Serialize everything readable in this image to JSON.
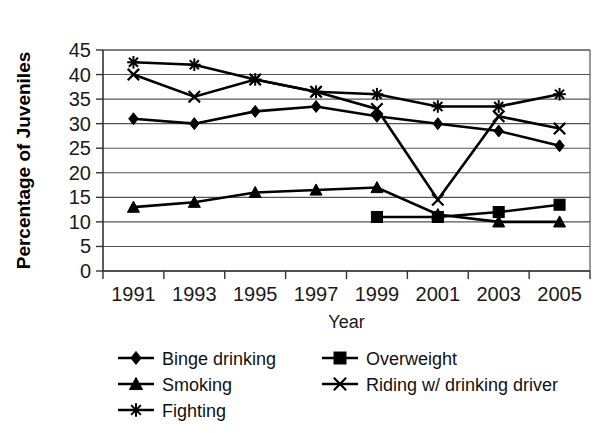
{
  "chart_data": {
    "type": "line",
    "title": "",
    "xlabel": "Year",
    "ylabel": "Percentage of Juveniles",
    "categories": [
      "1991",
      "1993",
      "1995",
      "1997",
      "1999",
      "2001",
      "2003",
      "2005"
    ],
    "x": [
      1991,
      1993,
      1995,
      1997,
      1999,
      2001,
      2003,
      2005
    ],
    "ylim": [
      0,
      45
    ],
    "yticks": [
      "0",
      "5",
      "10",
      "15",
      "20",
      "25",
      "30",
      "35",
      "40",
      "45"
    ],
    "ytick_values": [
      0,
      5,
      10,
      15,
      20,
      25,
      30,
      35,
      40,
      45
    ],
    "grid": true,
    "legend_position": "bottom",
    "series": [
      {
        "name": "Binge drinking",
        "marker": "diamond",
        "values": [
          31,
          30,
          32.5,
          33.5,
          31.5,
          30,
          28.5,
          25.5
        ]
      },
      {
        "name": "Overweight",
        "marker": "square",
        "values": [
          null,
          null,
          null,
          null,
          11,
          11,
          12,
          13.5
        ]
      },
      {
        "name": "Smoking",
        "marker": "triangle",
        "values": [
          13,
          14,
          16,
          16.5,
          17,
          11.5,
          10,
          10
        ]
      },
      {
        "name": "Riding w/ drinking driver",
        "marker": "x",
        "values": [
          40,
          35.5,
          39,
          36.5,
          33,
          14.5,
          31.5,
          29
        ]
      },
      {
        "name": "Fighting",
        "marker": "star",
        "values": [
          42.5,
          42,
          39,
          36.5,
          36,
          33.5,
          33.5,
          36
        ]
      }
    ]
  },
  "legend": {
    "entries": [
      {
        "label": "Binge drinking",
        "marker": "diamond"
      },
      {
        "label": "Overweight",
        "marker": "square"
      },
      {
        "label": "Smoking",
        "marker": "triangle"
      },
      {
        "label": "Riding w/ drinking driver",
        "marker": "x"
      },
      {
        "label": "Fighting",
        "marker": "star"
      }
    ]
  },
  "colors": {
    "ink": "#000000",
    "grid": "#555555",
    "background": "#ffffff"
  }
}
